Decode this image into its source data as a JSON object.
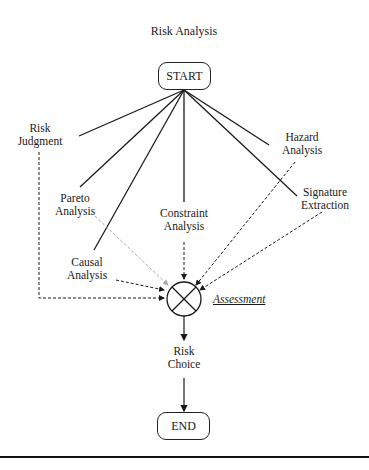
{
  "diagram": {
    "title": "Risk Analysis",
    "start_label": "START",
    "end_label": "END",
    "assessment_label": "Assessment",
    "nodes": {
      "risk_judgment": [
        "Risk",
        "Judgment"
      ],
      "pareto_analysis": [
        "Pareto",
        "Analysis"
      ],
      "causal_analysis": [
        "Causal",
        "Analysis"
      ],
      "constraint_analysis": [
        "Constraint",
        "Analysis"
      ],
      "hazard_analysis": [
        "Hazard",
        "Analysis"
      ],
      "signature_extraction": [
        "Signature",
        "Extraction"
      ],
      "risk_choice": [
        "Risk",
        "Choice"
      ]
    },
    "colors": {
      "line": "#1a1a1a",
      "pareto_arrow": "#aaaaaa"
    }
  }
}
